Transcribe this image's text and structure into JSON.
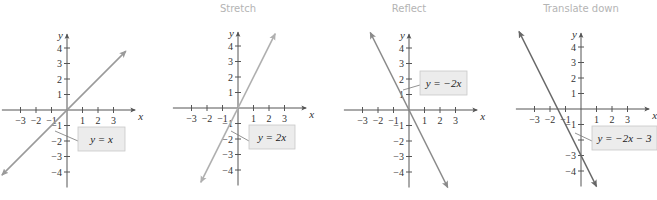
{
  "panels": [
    {
      "title": "",
      "equation": "y = x",
      "origin": [
        67,
        110
      ],
      "line_color": "#9a9a9a",
      "label_box": [
        78,
        127,
        47,
        24
      ],
      "leader": [
        [
          55,
          131
        ],
        [
          78,
          141
        ]
      ]
    },
    {
      "title": "Stretch",
      "equation": "y = 2x",
      "origin": [
        238,
        108
      ],
      "line_color": "#b0b0b0",
      "label_box": [
        249,
        125,
        46,
        24
      ],
      "leader": [
        [
          231,
          131
        ],
        [
          249,
          141
        ]
      ]
    },
    {
      "title": "Reflect",
      "equation": "y = −2x",
      "origin": [
        409,
        110
      ],
      "line_color": "#8a8a8a",
      "label_box": [
        420,
        71,
        47,
        24
      ],
      "leader": [
        [
          403,
          90
        ],
        [
          420,
          85
        ]
      ]
    },
    {
      "title": "Translate down",
      "equation": "y = −2x − 3",
      "origin": [
        581,
        109
      ],
      "line_color": "#666666",
      "label_box": [
        592,
        126,
        65,
        24
      ],
      "leader": [
        [
          575,
          133
        ],
        [
          592,
          141
        ]
      ]
    }
  ],
  "chart_data": [
    {
      "type": "line",
      "title": "",
      "xlabel": "x",
      "ylabel": "y",
      "xticks": [
        -3,
        -2,
        -1,
        1,
        2,
        3
      ],
      "yticks": [
        -4,
        -3,
        -2,
        -1,
        1,
        2,
        3,
        4
      ],
      "xlim": [
        -4,
        4
      ],
      "ylim": [
        -5,
        5
      ],
      "series": [
        {
          "name": "y = x",
          "slope": 1,
          "intercept": 0,
          "x": [
            -4.2,
            3.8
          ],
          "y": [
            -4.2,
            3.8
          ]
        }
      ]
    },
    {
      "type": "line",
      "title": "Stretch",
      "xlabel": "x",
      "ylabel": "y",
      "xticks": [
        -3,
        -2,
        -1,
        1,
        2,
        3
      ],
      "yticks": [
        -4,
        -3,
        -2,
        -1,
        1,
        2,
        3,
        4
      ],
      "xlim": [
        -4,
        4
      ],
      "ylim": [
        -5,
        5
      ],
      "series": [
        {
          "name": "y = 2x",
          "slope": 2,
          "intercept": 0,
          "x": [
            -2.4,
            2.4
          ],
          "y": [
            -4.8,
            4.8
          ]
        }
      ]
    },
    {
      "type": "line",
      "title": "Reflect",
      "xlabel": "x",
      "ylabel": "y",
      "xticks": [
        -3,
        -2,
        -1,
        1,
        2,
        3
      ],
      "yticks": [
        -4,
        -3,
        -2,
        -1,
        1,
        2,
        3,
        4
      ],
      "xlim": [
        -4,
        4
      ],
      "ylim": [
        -5,
        5
      ],
      "series": [
        {
          "name": "y = -2x",
          "slope": -2,
          "intercept": 0,
          "x": [
            -2.5,
            2.5
          ],
          "y": [
            5,
            -5
          ]
        }
      ]
    },
    {
      "type": "line",
      "title": "Translate down",
      "xlabel": "x",
      "ylabel": "y",
      "xticks": [
        -3,
        -2,
        -1,
        1,
        2,
        3
      ],
      "yticks": [
        -4,
        -3,
        -1,
        1,
        2,
        3,
        4
      ],
      "xlim": [
        -4,
        4
      ],
      "ylim": [
        -5,
        5
      ],
      "series": [
        {
          "name": "y = -2x - 3",
          "slope": -2,
          "intercept": -3,
          "x": [
            -4,
            1
          ],
          "y": [
            5,
            -5
          ]
        }
      ]
    }
  ],
  "axes": {
    "x_label": "x",
    "y_label": "y",
    "x_ticks": [
      "−3",
      "−2",
      "−1",
      "1",
      "2",
      "3"
    ],
    "y_ticks": [
      "4",
      "3",
      "2",
      "1",
      "−1",
      "−2",
      "−3",
      "−4"
    ]
  }
}
